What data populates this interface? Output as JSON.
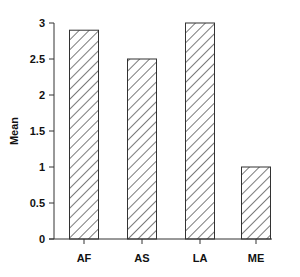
{
  "chart_data": {
    "type": "bar",
    "title": "",
    "xlabel": "",
    "ylabel": "Mean",
    "categories": [
      "AF",
      "AS",
      "LA",
      "ME"
    ],
    "values": [
      2.9,
      2.5,
      3.0,
      1.0
    ],
    "ylim": [
      0,
      3
    ],
    "yticks": [
      0,
      0.5,
      1,
      1.5,
      2,
      2.5,
      3
    ],
    "ytick_labels": [
      "0",
      "0.5",
      "1",
      "1.5",
      "2",
      "2.5",
      "3"
    ],
    "grid": false,
    "legend": null,
    "bar_fill": "diagonal-hatch",
    "colors": {
      "bar_stroke": "#333333",
      "hatch": "#333333",
      "background": "#ffffff"
    }
  }
}
